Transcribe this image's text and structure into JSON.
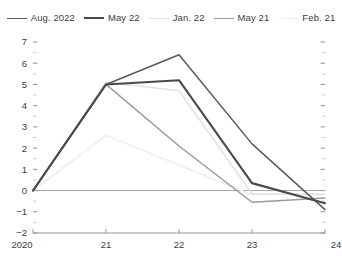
{
  "legend": {
    "position": "top-center",
    "items": [
      {
        "label": "Aug. 2022",
        "color": "#5a5a5a",
        "width": 1.5
      },
      {
        "label": "May 22",
        "color": "#4a4a4a",
        "width": 2.1
      },
      {
        "label": "Jan. 22",
        "color": "#e2e2e2",
        "width": 1.5
      },
      {
        "label": "May 21",
        "color": "#9a9a9a",
        "width": 1.5
      },
      {
        "label": "Feb. 21",
        "color": "#ededed",
        "width": 1.5
      }
    ]
  },
  "axes": {
    "x_ticks": [
      "2020",
      "21",
      "22",
      "23",
      "24"
    ],
    "y_ticks": [
      "7",
      "6",
      "5",
      "4",
      "3",
      "2",
      "1",
      "0",
      "-1",
      "-2"
    ],
    "x_values": [
      2020,
      2021,
      2022,
      2023,
      2024
    ],
    "xlim": [
      2020,
      2024
    ],
    "ylim": [
      -2,
      7
    ],
    "y_major_step": 1,
    "y_minor_step": 0.5,
    "zero_line": 0
  },
  "chart_data": {
    "type": "line",
    "title": "",
    "xlabel": "",
    "ylabel": "",
    "x": [
      2020,
      2021,
      2022,
      2023,
      2024
    ],
    "categories": [
      "2020",
      "21",
      "22",
      "23",
      "24"
    ],
    "xlim": [
      2020,
      2024
    ],
    "ylim": [
      -2,
      7
    ],
    "grid": false,
    "legend_position": "top-center",
    "annotations": [],
    "series": [
      {
        "name": "Aug. 2022",
        "color": "#5a5a5a",
        "width": 1.5,
        "values": [
          0,
          5.0,
          6.4,
          2.2,
          -0.9
        ]
      },
      {
        "name": "May 22",
        "color": "#4a4a4a",
        "width": 2.1,
        "values": [
          0,
          5.0,
          5.2,
          0.35,
          -0.6
        ]
      },
      {
        "name": "Jan. 22",
        "color": "#e2e2e2",
        "width": 1.5,
        "values": [
          0,
          5.1,
          4.7,
          -0.15,
          -0.2
        ]
      },
      {
        "name": "May 21",
        "color": "#9a9a9a",
        "width": 1.5,
        "values": [
          0,
          5.0,
          2.1,
          -0.55,
          -0.35
        ]
      },
      {
        "name": "Feb. 21",
        "color": "#ededed",
        "width": 1.5,
        "values": [
          0,
          2.6,
          1.2,
          -0.2,
          -0.15
        ]
      }
    ]
  }
}
